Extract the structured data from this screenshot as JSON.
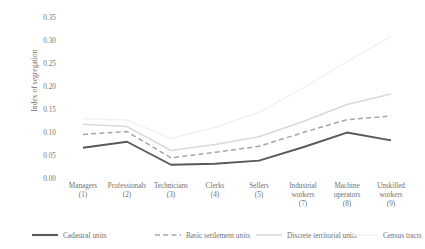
{
  "chart_data": {
    "type": "line",
    "title": "",
    "xlabel": "",
    "ylabel": "Index of segregation",
    "ylim": [
      0.0,
      0.35
    ],
    "ytick_labels": [
      "0.35",
      "0.30",
      "0.25",
      "0.20",
      "0.15",
      "0.10",
      "0.05",
      "0.00"
    ],
    "ytick_values": [
      0.35,
      0.3,
      0.25,
      0.2,
      0.15,
      0.1,
      0.05,
      0.0
    ],
    "grid": false,
    "legend_position": "bottom",
    "categories": [
      "Managers",
      "Professionals",
      "Technicians",
      "Clerks",
      "Sellers",
      "Industrial workers",
      "Machine operators",
      "Unskilled workers"
    ],
    "category_numbers": [
      "(1)",
      "(2)",
      "(3)",
      "(4)",
      "(5)",
      "(7)",
      "(8)",
      "(9)"
    ],
    "series": [
      {
        "name": "Cadastral units",
        "style": "solid",
        "color": "#595959",
        "values": [
          0.068,
          0.081,
          0.031,
          0.033,
          0.04,
          0.069,
          0.101,
          0.084
        ]
      },
      {
        "name": "Basic settlement units",
        "style": "dashed",
        "color": "#a6a6a6",
        "values": [
          0.097,
          0.103,
          0.046,
          0.058,
          0.071,
          0.101,
          0.129,
          0.137
        ]
      },
      {
        "name": "Discrete territorial units",
        "style": "solid",
        "color": "#d9d9d9",
        "values": [
          0.119,
          0.114,
          0.062,
          0.075,
          0.092,
          0.125,
          0.162,
          0.185
        ]
      },
      {
        "name": "Census tracts",
        "style": "solid",
        "color": "#f2f2f2",
        "values": [
          0.131,
          0.128,
          0.088,
          0.112,
          0.145,
          0.198,
          0.255,
          0.31
        ]
      }
    ]
  },
  "legend": {
    "items": [
      {
        "label": "Cadastral units"
      },
      {
        "label": "Basic settlement units"
      },
      {
        "label": "Discrete territorial units"
      },
      {
        "label": "Census tracts"
      }
    ]
  }
}
